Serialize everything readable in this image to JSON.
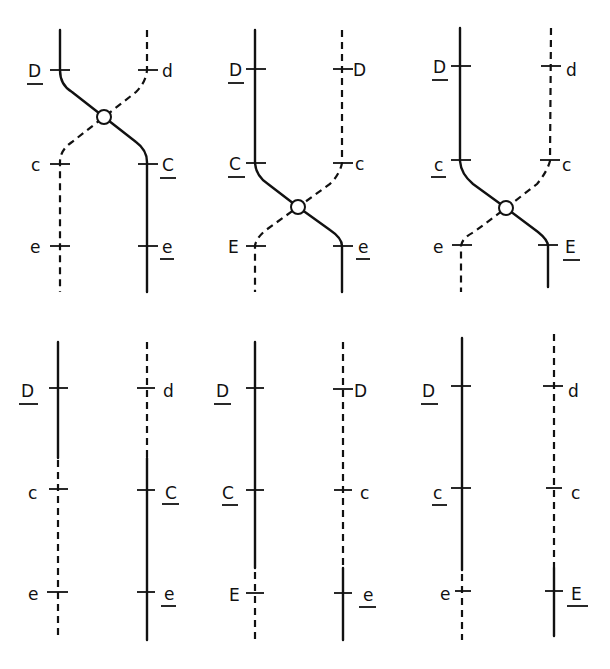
{
  "diagram": {
    "title": "",
    "colors": {
      "line": "#111111",
      "background": "#ffffff"
    },
    "top_row": [
      {
        "id": "top-1",
        "crossover_region": "D-C",
        "left_labels": [
          {
            "text": "D",
            "underlined": true
          },
          {
            "text": "c",
            "underlined": false
          },
          {
            "text": "e",
            "underlined": false
          }
        ],
        "right_labels": [
          {
            "text": "d",
            "underlined": false
          },
          {
            "text": "C",
            "underlined": true
          },
          {
            "text": "e",
            "underlined": true
          }
        ]
      },
      {
        "id": "top-2",
        "crossover_region": "C-E",
        "left_labels": [
          {
            "text": "D",
            "underlined": true
          },
          {
            "text": "C",
            "underlined": true
          },
          {
            "text": "E",
            "underlined": false
          }
        ],
        "right_labels": [
          {
            "text": "D",
            "underlined": false
          },
          {
            "text": "c",
            "underlined": false
          },
          {
            "text": "e",
            "underlined": true
          }
        ]
      },
      {
        "id": "top-3",
        "crossover_region": "C-E",
        "left_labels": [
          {
            "text": "D",
            "underlined": true
          },
          {
            "text": "c",
            "underlined": true
          },
          {
            "text": "e",
            "underlined": false
          }
        ],
        "right_labels": [
          {
            "text": "d",
            "underlined": false
          },
          {
            "text": "c",
            "underlined": false
          },
          {
            "text": "E",
            "underlined": true
          }
        ]
      }
    ],
    "bottom_row": [
      {
        "id": "bottom-1",
        "left_labels": [
          {
            "text": "D",
            "underlined": true
          },
          {
            "text": "c",
            "underlined": false
          },
          {
            "text": "e",
            "underlined": false
          }
        ],
        "right_labels": [
          {
            "text": "d",
            "underlined": false
          },
          {
            "text": "C",
            "underlined": true
          },
          {
            "text": "e",
            "underlined": true
          }
        ]
      },
      {
        "id": "bottom-2",
        "left_labels": [
          {
            "text": "D",
            "underlined": true
          },
          {
            "text": "C",
            "underlined": true
          },
          {
            "text": "E",
            "underlined": false
          }
        ],
        "right_labels": [
          {
            "text": "D",
            "underlined": false
          },
          {
            "text": "c",
            "underlined": false
          },
          {
            "text": "e",
            "underlined": true
          }
        ]
      },
      {
        "id": "bottom-3",
        "left_labels": [
          {
            "text": "D",
            "underlined": true
          },
          {
            "text": "c",
            "underlined": true
          },
          {
            "text": "e",
            "underlined": false
          }
        ],
        "right_labels": [
          {
            "text": "d",
            "underlined": false
          },
          {
            "text": "c",
            "underlined": false
          },
          {
            "text": "E",
            "underlined": true
          }
        ]
      }
    ],
    "legend": {
      "solid_line": "chromosome strand (parent 1)",
      "dashed_line": "chromosome strand (parent 2)",
      "open_circle": "chiasma / crossover point"
    }
  }
}
